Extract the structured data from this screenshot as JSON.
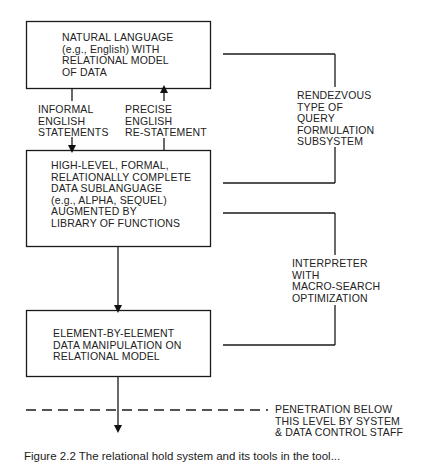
{
  "boxes": [
    {
      "id": "natural-language",
      "text": "NATURAL LANGUAGE\n(e.g., English) WITH\nRELATIONAL MODEL\nOF DATA"
    },
    {
      "id": "data-sublanguage",
      "text": "HIGH-LEVEL, FORMAL,\nRELATIONALLY COMPLETE\nDATA SUBLANGUAGE\n(e.g., ALPHA, SEQUEL)\nAUGMENTED BY\nLIBRARY OF FUNCTIONS"
    },
    {
      "id": "element-manipulation",
      "text": "ELEMENT-BY-ELEMENT\nDATA MANIPULATION ON\nRELATIONAL MODEL"
    }
  ],
  "arrow_labels": {
    "down": "INFORMAL\nENGLISH\nSTATEMENTS",
    "up": "PRECISE\nENGLISH\nRE-STATEMENT"
  },
  "brackets": [
    {
      "id": "rendezvous",
      "text": "RENDEZVOUS\nTYPE OF\nQUERY\nFORMULATION\nSUBSYSTEM"
    },
    {
      "id": "interpreter",
      "text": "INTERPRETER\nWITH\nMACRO-SEARCH\nOPTIMIZATION"
    }
  ],
  "penetration_note": "PENETRATION BELOW\nTHIS LEVEL BY SYSTEM\n& DATA CONTROL STAFF",
  "caption": "Figure 2.2   The relational hold system and its tools in the tool..."
}
